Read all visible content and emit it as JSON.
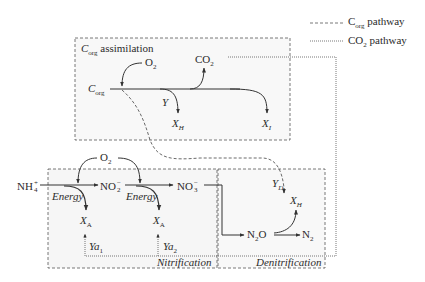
{
  "legend": {
    "items": [
      {
        "line_style": "dashed",
        "label_main": "C",
        "label_sub": "org",
        "label_rest": " pathway"
      },
      {
        "line_style": "dotted",
        "label_main": "CO",
        "label_sub": "2",
        "label_rest": " pathway"
      }
    ]
  },
  "boxes": {
    "assimilation": {
      "title_main": "C",
      "title_sub": "org",
      "title_rest": " assimilation"
    },
    "nitrification": {
      "title": "Nitrification"
    },
    "denitrification": {
      "title": "Denitrification"
    }
  },
  "assimilation": {
    "source": {
      "main": "C",
      "sub": "org"
    },
    "oxygen": {
      "main": "O",
      "sub": "2"
    },
    "co2": {
      "main": "CO",
      "sub": "2"
    },
    "yield": "Y",
    "heterotroph": {
      "main": "X",
      "sub": "H"
    },
    "inert": {
      "main": "X",
      "sub": "I"
    }
  },
  "nitrification": {
    "ammonium": {
      "main": "NH",
      "sub": "4",
      "sup": "+"
    },
    "oxygen": {
      "main": "O",
      "sub": "2"
    },
    "nitrite": {
      "main": "NO",
      "sub": "2",
      "sup": "−"
    },
    "nitrate": {
      "main": "NO",
      "sub": "3",
      "sup": "−"
    },
    "energy_1": "Energy",
    "energy_2": "Energy",
    "autotroph_1": {
      "main": "X",
      "sub": "A"
    },
    "autotroph_2": {
      "main": "X",
      "sub": "A"
    },
    "yield_1": {
      "main": "Ya",
      "sub": "1"
    },
    "yield_2": {
      "main": "Ya",
      "sub": "2"
    }
  },
  "denitrification": {
    "yield": {
      "main": "Y",
      "sub": "D"
    },
    "heterotroph": {
      "main": "X",
      "sub": "H"
    },
    "nitrous_oxide": {
      "main": "N",
      "sub": "2",
      "rest": "O"
    },
    "nitrogen": {
      "main": "N",
      "sub": "2"
    }
  },
  "colors": {
    "line": "#333333",
    "box_border": "#555555",
    "box_fill": "#f7f7f7"
  }
}
